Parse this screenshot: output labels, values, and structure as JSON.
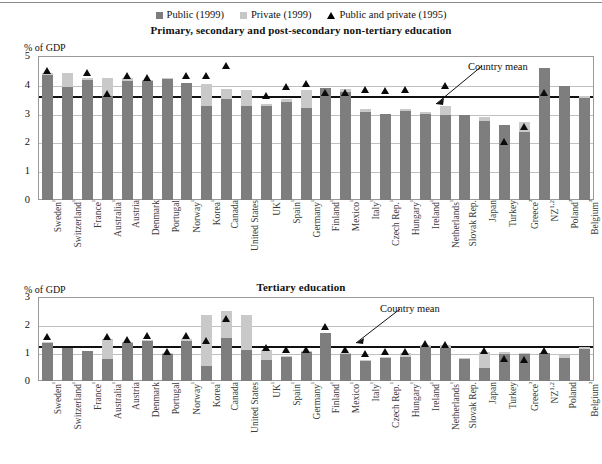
{
  "legend": {
    "items": [
      {
        "label": "Public (1999)",
        "marker": "square-dark-icon",
        "color": "#7d7d7d"
      },
      {
        "label": "Private (1999)",
        "marker": "square-light-icon",
        "color": "#c6c6c6"
      },
      {
        "label": "Public and private (1995)",
        "marker": "triangle-icon",
        "color": "#000000"
      }
    ]
  },
  "panels": {
    "top": {
      "title": "Primary, secondary and post-secondary non-tertiary education",
      "axis_unit": "% of GDP",
      "annotation": "Country mean"
    },
    "bottom": {
      "title": "Tertiary education",
      "axis_unit": "% of GDP",
      "annotation": "Country mean"
    }
  },
  "chart_data": [
    {
      "type": "bar",
      "title": "Primary, secondary and post-secondary non-tertiary education",
      "subtitle": "",
      "xlabel": "",
      "ylabel": "% of GDP",
      "ylim": [
        0,
        5
      ],
      "yticks": [
        0,
        1,
        2,
        3,
        4,
        5
      ],
      "grid": true,
      "legend_position": "top-center",
      "stacked": true,
      "country_mean": 3.65,
      "categories": [
        "Sweden¹",
        "Switzerland¹",
        "France¹",
        "Australia¹",
        "Austria",
        "Denmark",
        "Portugal",
        "Norway¹",
        "Korea¹",
        "Canada",
        "United States",
        "UK¹",
        "Spain¹",
        "Germany¹",
        "Finland¹",
        "Mexico¹",
        "Italy¹",
        "Czech Rep.¹",
        "Hungary¹",
        "Ireland¹",
        "Netherlands¹",
        "Slovak Rep.",
        "Japan",
        "Turkey",
        "Greece²",
        "NZ1,2",
        "Poland²",
        "Belgium²"
      ],
      "series": [
        {
          "name": "Public (1999)",
          "color": "#7e7e7e",
          "values": [
            4.35,
            3.92,
            4.17,
            3.6,
            4.12,
            4.13,
            4.2,
            4.05,
            3.27,
            3.5,
            3.28,
            3.25,
            3.4,
            3.18,
            3.9,
            3.75,
            3.05,
            3.0,
            3.1,
            3.0,
            2.95,
            2.95,
            2.75,
            2.6,
            2.35,
            4.6,
            3.95,
            3.55
          ]
        },
        {
          "name": "Private (1999)",
          "color": "#c9c9c9",
          "values": [
            0.05,
            0.5,
            0.05,
            0.65,
            0.1,
            0.05,
            0.05,
            0.0,
            0.75,
            0.35,
            0.55,
            0.1,
            0.1,
            0.65,
            0.0,
            0.1,
            0.1,
            0.0,
            0.05,
            0.05,
            0.3,
            0.0,
            0.15,
            0.0,
            0.35,
            0.0,
            0.0,
            0.05
          ]
        }
      ],
      "markers": {
        "name": "Public and private (1995)",
        "symbol": "triangle",
        "color": "#0a0a0a",
        "values": [
          4.4,
          null,
          4.35,
          3.6,
          4.25,
          4.15,
          null,
          4.25,
          4.25,
          4.6,
          null,
          3.55,
          3.85,
          3.95,
          3.65,
          3.65,
          3.75,
          3.7,
          3.75,
          null,
          3.9,
          null,
          null,
          1.95,
          2.45,
          3.65,
          null,
          null
        ]
      }
    },
    {
      "type": "bar",
      "title": "Tertiary education",
      "subtitle": "",
      "xlabel": "",
      "ylabel": "% of GDP",
      "ylim": [
        0,
        3
      ],
      "yticks": [
        0,
        1,
        2,
        3
      ],
      "grid": true,
      "legend_position": "top-center",
      "stacked": true,
      "country_mean": 1.3,
      "categories": [
        "Sweden¹",
        "Switzerland¹",
        "France¹",
        "Australia¹",
        "Austria",
        "Denmark",
        "Portugal",
        "Norway¹",
        "Korea¹",
        "Canada",
        "United States",
        "UK¹",
        "Spain¹",
        "Germany¹",
        "Finland¹",
        "Mexico¹",
        "Italy¹",
        "Czech Rep.¹",
        "Hungary¹",
        "Ireland¹",
        "Netherlands¹",
        "Slovak Rep.",
        "Japan",
        "Turkey",
        "Greece²",
        "NZ1,2",
        "Poland",
        "Belgium²"
      ],
      "series": [
        {
          "name": "Public (1999)",
          "color": "#7e7e7e",
          "values": [
            1.35,
            1.18,
            1.08,
            0.8,
            1.38,
            1.45,
            0.95,
            1.42,
            0.52,
            1.55,
            1.1,
            0.75,
            0.88,
            1.02,
            1.72,
            0.95,
            0.72,
            0.82,
            0.85,
            1.22,
            1.18,
            0.78,
            0.48,
            0.95,
            0.95,
            1.0,
            0.82,
            1.15
          ]
        },
        {
          "name": "Private (1999)",
          "color": "#c9c9c9",
          "values": [
            0.05,
            0.0,
            0.0,
            0.7,
            0.02,
            0.02,
            0.05,
            0.08,
            1.85,
            0.95,
            1.25,
            0.35,
            0.02,
            0.05,
            0.0,
            0.05,
            0.03,
            0.05,
            0.15,
            0.05,
            0.12,
            0.05,
            0.55,
            0.1,
            0.05,
            0.0,
            0.1,
            0.08
          ]
        }
      ],
      "markers": {
        "name": "Public and private (1995)",
        "symbol": "triangle",
        "color": "#0a0a0a",
        "values": [
          1.5,
          null,
          null,
          1.5,
          1.4,
          1.52,
          0.95,
          1.55,
          1.35,
          2.15,
          null,
          1.12,
          1.05,
          1.05,
          1.85,
          1.05,
          0.88,
          0.95,
          0.95,
          1.25,
          1.2,
          null,
          1.0,
          0.72,
          0.68,
          1.0,
          null,
          null
        ]
      }
    }
  ]
}
